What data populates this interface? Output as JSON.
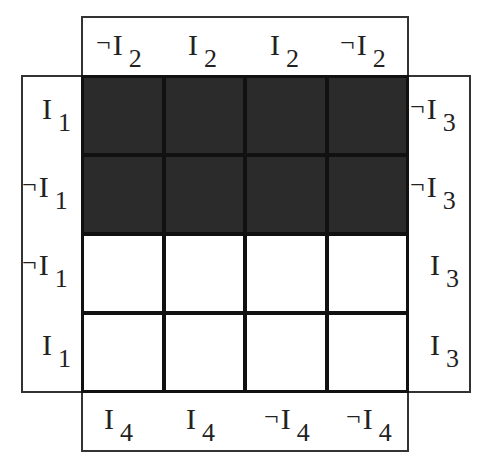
{
  "diagram": {
    "type": "karnaugh-map",
    "rows": 4,
    "columns": 4,
    "fill_color": "#2b2b2b",
    "empty_color": "#ffffff",
    "cells": [
      [
        1,
        1,
        1,
        1
      ],
      [
        1,
        1,
        1,
        1
      ],
      [
        0,
        0,
        0,
        0
      ],
      [
        0,
        0,
        0,
        0
      ]
    ],
    "top_labels": [
      {
        "neg": "¬",
        "var": "I",
        "sub": "2"
      },
      {
        "neg": "",
        "var": "I",
        "sub": "2"
      },
      {
        "neg": "",
        "var": "I",
        "sub": "2"
      },
      {
        "neg": "¬",
        "var": "I",
        "sub": "2"
      }
    ],
    "left_labels": [
      {
        "neg": "",
        "var": "I",
        "sub": "1"
      },
      {
        "neg": "¬",
        "var": "I",
        "sub": "1"
      },
      {
        "neg": "¬",
        "var": "I",
        "sub": "1"
      },
      {
        "neg": "",
        "var": "I",
        "sub": "1"
      }
    ],
    "right_labels": [
      {
        "neg": "¬",
        "var": "I",
        "sub": "3"
      },
      {
        "neg": "¬",
        "var": "I",
        "sub": "3"
      },
      {
        "neg": "",
        "var": "I",
        "sub": "3"
      },
      {
        "neg": "",
        "var": "I",
        "sub": "3"
      }
    ],
    "bottom_labels": [
      {
        "neg": "",
        "var": "I",
        "sub": "4"
      },
      {
        "neg": "",
        "var": "I",
        "sub": "4"
      },
      {
        "neg": "¬",
        "var": "I",
        "sub": "4"
      },
      {
        "neg": "¬",
        "var": "I",
        "sub": "4"
      }
    ]
  }
}
